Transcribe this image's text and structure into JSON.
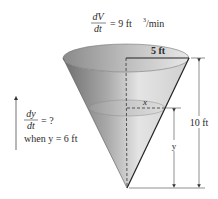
{
  "rate_given": {
    "numerator": "dV",
    "denominator": "dt",
    "equals": "= 9 ft",
    "exponent": "3",
    "unit_suffix": "/min"
  },
  "question": {
    "numerator": "dy",
    "denominator": "dt",
    "equals": "= ?",
    "condition": "when y = 6 ft"
  },
  "dimensions": {
    "radius_label": "5 ft",
    "height_label": "10 ft",
    "water_radius_label": "x",
    "water_height_label": "y"
  },
  "colors": {
    "cone_dark": "#7a7a7a",
    "cone_light": "#dcdcdc",
    "water": "#b8b8b8",
    "line": "#222222"
  }
}
